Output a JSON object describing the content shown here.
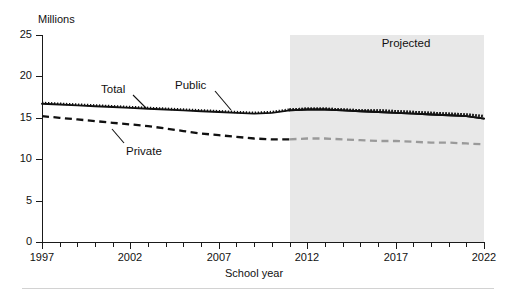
{
  "chart_data": {
    "type": "line",
    "title": "",
    "subtitle": "",
    "xlabel": "School year",
    "ylabel": "Millions",
    "units_label": "Millions",
    "xlim": [
      1997,
      2022
    ],
    "ylim": [
      0,
      25
    ],
    "yticks": [
      0,
      5,
      10,
      15,
      20,
      25
    ],
    "ytick_labels": [
      "0",
      "5",
      "10",
      "15",
      "20",
      "25"
    ],
    "xticks": [
      1997,
      2002,
      2007,
      2012,
      2017,
      2022
    ],
    "xtick_labels": [
      "1997",
      "2002",
      "2007",
      "2012",
      "2017",
      "2022"
    ],
    "x_minor_tick_interval": 1,
    "grid": false,
    "legend_position": "inline-annotations",
    "annotations": [
      {
        "text": "Total",
        "series": "Total"
      },
      {
        "text": "Public",
        "series": "Public"
      },
      {
        "text": "Private",
        "series": "Private"
      },
      {
        "text": "Projected",
        "series": ""
      }
    ],
    "projection": {
      "label": "Projected",
      "start_year": 2011,
      "end_year": 2022,
      "shade_color": "#e8e8e8"
    },
    "x": [
      1997,
      1998,
      1999,
      2000,
      2001,
      2002,
      2003,
      2004,
      2005,
      2006,
      2007,
      2008,
      2009,
      2010,
      2011,
      2012,
      2013,
      2014,
      2015,
      2016,
      2017,
      2018,
      2019,
      2020,
      2021,
      2022
    ],
    "series": [
      {
        "name": "Total",
        "style": "solid",
        "color": "#111111",
        "values": [
          16.7,
          16.6,
          16.5,
          16.4,
          16.3,
          16.2,
          16.1,
          16.0,
          15.9,
          15.8,
          15.7,
          15.6,
          15.5,
          15.6,
          15.9,
          16.0,
          16.0,
          15.9,
          15.8,
          15.7,
          15.6,
          15.5,
          15.4,
          15.3,
          15.2,
          14.9
        ]
      },
      {
        "name": "Public",
        "style": "dotted",
        "color": "#111111",
        "values": [
          16.8,
          16.7,
          16.6,
          16.5,
          16.4,
          16.3,
          16.2,
          16.1,
          16.0,
          15.9,
          15.8,
          15.7,
          15.6,
          15.7,
          16.0,
          16.1,
          16.1,
          16.0,
          15.9,
          15.9,
          15.8,
          15.7,
          15.6,
          15.5,
          15.4,
          15.2
        ]
      },
      {
        "name": "Private",
        "style": "dashed",
        "color": "#111111",
        "values": [
          15.2,
          15.0,
          14.8,
          14.6,
          14.4,
          14.2,
          14.0,
          13.7,
          13.4,
          13.1,
          12.9,
          12.7,
          12.5,
          12.4,
          12.4,
          12.5,
          12.5,
          12.4,
          12.3,
          12.2,
          12.2,
          12.1,
          12.0,
          12.0,
          11.9,
          11.8
        ]
      }
    ]
  }
}
